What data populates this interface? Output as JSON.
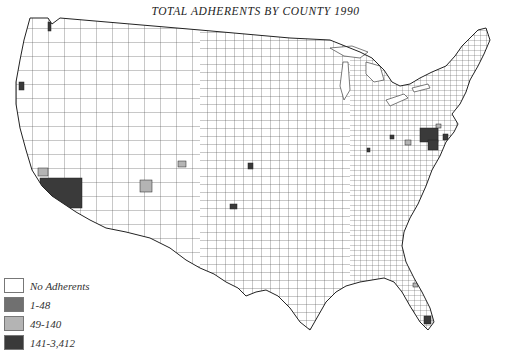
{
  "title": "TOTAL ADHERENTS BY COUNTY 1990",
  "legend": [
    {
      "label": "No Adherents",
      "color": "#ffffff"
    },
    {
      "label": "1-48",
      "color": "#707070"
    },
    {
      "label": "49-140",
      "color": "#b4b4b4"
    },
    {
      "label": "141-3,412",
      "color": "#3a3a3a"
    }
  ],
  "map": {
    "region": "Contiguous United States",
    "unit": "county",
    "year": "1990",
    "shaded_counties": [
      {
        "area": "Southern California (large)",
        "class": "141-3,412",
        "x": 40,
        "y": 178,
        "w": 42,
        "h": 30
      },
      {
        "area": "Central California",
        "class": "49-140",
        "x": 38,
        "y": 168,
        "w": 10,
        "h": 8
      },
      {
        "area": "Northern California coast",
        "class": "141-3,412",
        "x": 19,
        "y": 82,
        "w": 5,
        "h": 8
      },
      {
        "area": "Washington north",
        "class": "141-3,412",
        "x": 48,
        "y": 22,
        "w": 3,
        "h": 9
      },
      {
        "area": "Utah",
        "class": "49-140",
        "x": 178,
        "y": 161,
        "w": 8,
        "h": 6
      },
      {
        "area": "Arizona",
        "class": "49-140",
        "x": 140,
        "y": 180,
        "w": 12,
        "h": 12
      },
      {
        "area": "Kansas",
        "class": "141-3,412",
        "x": 248,
        "y": 163,
        "w": 5,
        "h": 6
      },
      {
        "area": "Oklahoma",
        "class": "141-3,412",
        "x": 230,
        "y": 204,
        "w": 7,
        "h": 5
      },
      {
        "area": "Pennsylvania cluster",
        "class": "141-3,412",
        "x": 420,
        "y": 128,
        "w": 18,
        "h": 14
      },
      {
        "area": "Pennsylvania/Maryland",
        "class": "141-3,412",
        "x": 428,
        "y": 140,
        "w": 10,
        "h": 10
      },
      {
        "area": "New Jersey",
        "class": "141-3,412",
        "x": 443,
        "y": 134,
        "w": 5,
        "h": 6
      },
      {
        "area": "Ohio",
        "class": "141-3,412",
        "x": 390,
        "y": 135,
        "w": 4,
        "h": 4
      },
      {
        "area": "Ohio south",
        "class": "49-140",
        "x": 405,
        "y": 140,
        "w": 6,
        "h": 5
      },
      {
        "area": "Indiana",
        "class": "141-3,412",
        "x": 367,
        "y": 148,
        "w": 3,
        "h": 4
      },
      {
        "area": "Pennsylvania east",
        "class": "49-140",
        "x": 436,
        "y": 124,
        "w": 5,
        "h": 4
      },
      {
        "area": "South Florida",
        "class": "141-3,412",
        "x": 424,
        "y": 316,
        "w": 7,
        "h": 8
      },
      {
        "area": "Florida central",
        "class": "49-140",
        "x": 413,
        "y": 283,
        "w": 5,
        "h": 4
      },
      {
        "area": "Florida west",
        "class": "49-140",
        "x": 408,
        "y": 310,
        "w": 5,
        "h": 4
      }
    ]
  }
}
